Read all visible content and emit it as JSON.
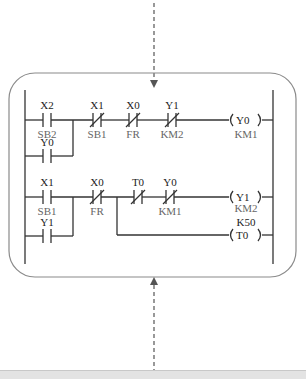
{
  "diagram": {
    "type": "PLC ladder diagram",
    "colors": {
      "line": "#333333",
      "frame": "#8a8a8a",
      "arrow": "#555555",
      "device_label": "#666666",
      "address_label": "#222222",
      "band": "#e3e3e3"
    },
    "rung1": {
      "contacts": [
        {
          "address": "X2",
          "device": "SB2",
          "type": "normally-open"
        },
        {
          "address": "X1",
          "device": "SB1",
          "type": "normally-closed"
        },
        {
          "address": "X0",
          "device": "FR",
          "type": "normally-closed"
        },
        {
          "address": "Y1",
          "device": "KM2",
          "type": "normally-closed"
        }
      ],
      "branch_contact": {
        "address": "Y0",
        "type": "normally-open"
      },
      "coil": {
        "address": "Y0",
        "device": "KM1"
      }
    },
    "rung2": {
      "contacts": [
        {
          "address": "X1",
          "device": "SB1",
          "type": "normally-open"
        },
        {
          "address": "X0",
          "device": "FR",
          "type": "normally-closed"
        },
        {
          "address": "T0",
          "type": "normally-closed"
        },
        {
          "address": "Y0",
          "device": "KM1",
          "type": "normally-closed"
        }
      ],
      "branch_contact": {
        "address": "Y1",
        "type": "normally-open"
      },
      "coil": {
        "address": "Y1",
        "device": "KM2"
      },
      "timer": {
        "address": "T0",
        "setting": "K50"
      }
    }
  }
}
